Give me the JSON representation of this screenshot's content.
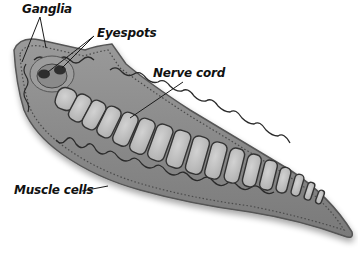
{
  "diagram": {
    "labels": [
      {
        "id": "ganglia",
        "text": "Ganglia"
      },
      {
        "id": "eyespots",
        "text": "Eyespots"
      },
      {
        "id": "nerve-cord",
        "text": "Nerve cord"
      },
      {
        "id": "muscle-cells",
        "text": "Muscle cells"
      }
    ]
  },
  "colors": {
    "body_fill": "#8a8a8a",
    "body_edge": "#5a5a5a",
    "segment_fill": "#c4c4c4",
    "segment_edge": "#3a3a3a",
    "label_text": "#111111",
    "leader_line": "#1a1a1a"
  }
}
